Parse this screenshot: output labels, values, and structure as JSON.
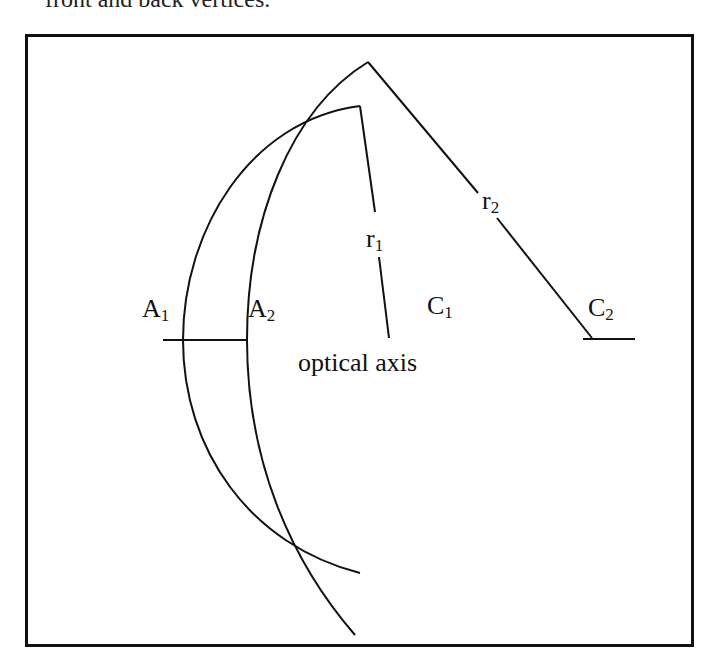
{
  "caption_fragment": "front and back vertices.",
  "diagram": {
    "labels": {
      "A1": {
        "main": "A",
        "sub": "1"
      },
      "A2": {
        "main": "A",
        "sub": "2"
      },
      "C1": {
        "main": "C",
        "sub": "1"
      },
      "C2": {
        "main": "C",
        "sub": "2"
      },
      "r1": {
        "main": "r",
        "sub": "1"
      },
      "r2": {
        "main": "r",
        "sub": "2"
      }
    },
    "axis_label": "optical axis",
    "stroke_color": "#111111"
  }
}
